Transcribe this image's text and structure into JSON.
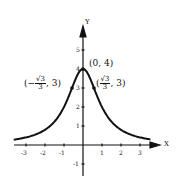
{
  "chart_data": {
    "type": "line",
    "title": "",
    "xlabel": "X",
    "ylabel": "Y",
    "function": "y = 4/(1+x^2)",
    "xlim": [
      -3.8,
      3.6
    ],
    "ylim": [
      -1.6,
      6.2
    ],
    "x_ticks": [
      "-3",
      "-2",
      "-1",
      "1",
      "2",
      "3"
    ],
    "y_ticks": [
      "-1",
      "1",
      "2",
      "3",
      "4",
      "5"
    ],
    "x": [
      -3.5,
      -3,
      -2.5,
      -2,
      -1.5,
      -1,
      -0.577,
      -0.5,
      0,
      0.5,
      0.577,
      1,
      1.5,
      2,
      2.5,
      3,
      3.5
    ],
    "y": [
      0.3,
      0.4,
      0.55,
      0.8,
      1.23,
      2.0,
      3.0,
      3.2,
      4.0,
      3.2,
      3.0,
      2.0,
      1.23,
      0.8,
      0.55,
      0.4,
      0.3
    ],
    "points": [
      {
        "label": "(0, 4)",
        "x": 0,
        "y": 4
      },
      {
        "label": "(-√3/3, 3)",
        "x": -0.577,
        "y": 3
      },
      {
        "label": "(√3/3, 3)",
        "x": 0.577,
        "y": 3
      }
    ],
    "grid": false,
    "legend": null
  },
  "labels": {
    "x_axis": "X",
    "y_axis": "Y",
    "peak": "(0, 4)",
    "left_num": "√3",
    "left_prefix": "(−",
    "left_den": "3",
    "left_suffix": ", 3)",
    "right_prefix": "(",
    "right_num": "√3",
    "right_den": "3",
    "right_suffix": ", 3)",
    "ticks_x": [
      "-3",
      "-2",
      "-1",
      "1",
      "2",
      "3"
    ],
    "ticks_y": [
      "-1",
      "1",
      "2",
      "3",
      "4",
      "5"
    ]
  }
}
